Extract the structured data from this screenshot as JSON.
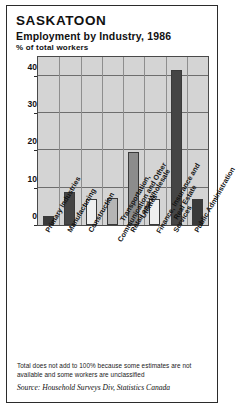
{
  "figure": {
    "title": "SASKATOON",
    "subtitle": "Employment by Industry, 1986",
    "units": "% of total workers",
    "footnote": "Total does not add to 100% because some estimates are not available and some workers are unclassified",
    "source": "Source: Household Surveys Div, Statistics Canada"
  },
  "chart_data": {
    "type": "bar",
    "title": "Employment by Industry, 1986",
    "subtitle": "SASKATOON",
    "xlabel": "",
    "ylabel": "% of total workers",
    "ylim": [
      0,
      45
    ],
    "yticks": [
      0,
      10,
      20,
      30,
      40
    ],
    "ytick_labels": [
      "0",
      "10",
      "20",
      "30",
      "40"
    ],
    "grid": true,
    "legend": "none",
    "categories": [
      "Primary Industries",
      "Manufacturing",
      "Construction",
      "Transportation, Communication and Other Utilities",
      "Retail and Wholesale",
      "Finance, Insurance and Real Estate",
      "Services",
      "Public Administration"
    ],
    "values": [
      2.5,
      8.8,
      7.0,
      7.3,
      19.5,
      7.0,
      41.5,
      7.0
    ],
    "bar_colors": [
      "#3a3a3a",
      "#454545",
      "#efefef",
      "#b5b5b5",
      "#8c8c8c",
      "#efefef",
      "#454545",
      "#3a3a3a"
    ],
    "plot_background": "#d4d4d4"
  }
}
